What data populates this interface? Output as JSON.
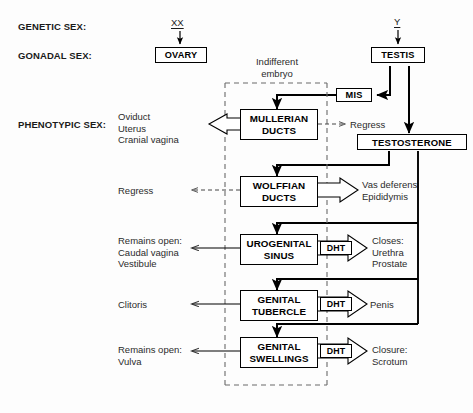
{
  "diagram": {
    "row_labels": [
      {
        "id": "genetic",
        "text": "GENETIC SEX:"
      },
      {
        "id": "gonadal",
        "text": "GONADAL SEX:"
      },
      {
        "id": "phenotypic",
        "text": "PHENOTYPIC SEX:"
      }
    ],
    "chromosomes": {
      "female": "XX",
      "male": "Y"
    },
    "gonads": {
      "female": "OVARY",
      "male": "TESTIS"
    },
    "hormones": {
      "mis": "MIS",
      "testosterone": "TESTOSTERONE",
      "dht": "DHT"
    },
    "indifferent_embryo": {
      "line1": "Indifferent",
      "line2": "embryo"
    },
    "rows": [
      {
        "id": "mullerian",
        "structure_line1": "MULLERIAN",
        "structure_line2": "DUCTS",
        "female_outcome": [
          "Oviduct",
          "Uterus",
          "Cranial vagina"
        ],
        "male_outcome": [
          "Regress"
        ],
        "female_arrow": "hollow-left",
        "male_arrow": "dashed-right",
        "dht": false
      },
      {
        "id": "wolffian",
        "structure_line1": "WOLFFIAN",
        "structure_line2": "DUCTS",
        "female_outcome": [
          "Regress"
        ],
        "male_outcome": [
          "Vas deferens",
          "Epididymis"
        ],
        "female_arrow": "dashed-left",
        "male_arrow": "hollow-right",
        "dht": false
      },
      {
        "id": "urogenital-sinus",
        "structure_line1": "UROGENITAL",
        "structure_line2": "SINUS",
        "female_outcome": [
          "Remains open:",
          "Caudal vagina",
          "Vestibule"
        ],
        "male_outcome": [
          "Closes:",
          "Urethra",
          "Prostate"
        ],
        "female_arrow": "solid-left",
        "male_arrow": "hollow-right",
        "dht": true
      },
      {
        "id": "genital-tubercle",
        "structure_line1": "GENITAL",
        "structure_line2": "TUBERCLE",
        "female_outcome": [
          "Clitoris"
        ],
        "male_outcome": [
          "Penis"
        ],
        "female_arrow": "solid-left",
        "male_arrow": "hollow-right",
        "dht": true
      },
      {
        "id": "genital-swellings",
        "structure_line1": "GENITAL",
        "structure_line2": "SWELLINGS",
        "female_outcome": [
          "Remains open:",
          "Vulva"
        ],
        "male_outcome": [
          "Closure:",
          "Scrotum"
        ],
        "female_arrow": "solid-left",
        "male_arrow": "hollow-right",
        "dht": true
      }
    ],
    "colors": {
      "line": "#000000",
      "dashed": "#5a5a5a",
      "text": "#1a1a1a",
      "background": "#fdfdfd"
    }
  }
}
